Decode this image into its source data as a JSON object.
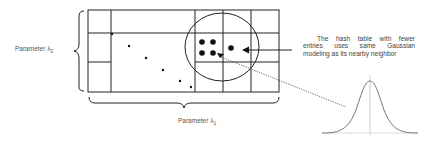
{
  "diagram": {
    "labels": {
      "param_y": "Parameter λ",
      "param_y_sub": "2",
      "param_x": "Parameter λ",
      "param_x_sub": "1"
    },
    "annotation": {
      "lines": [
        "The hash table with fewer",
        "entries uses same Gaussian",
        "modeling as its nearby neighbor"
      ]
    },
    "grid": {
      "x_lines": [
        88,
        111,
        195,
        223,
        251,
        279
      ],
      "y_lines": [
        10,
        33,
        62,
        92
      ]
    },
    "sparse_points": [
      [
        112,
        34
      ],
      [
        129,
        46
      ],
      [
        146,
        58
      ],
      [
        163,
        70
      ],
      [
        180,
        81
      ],
      [
        191,
        87
      ]
    ],
    "cluster_points": [
      [
        202,
        42
      ],
      [
        213,
        42
      ],
      [
        202,
        53
      ],
      [
        213,
        53
      ],
      [
        231,
        48
      ]
    ],
    "colors": {
      "line": "#222222",
      "text": "#555555",
      "gaussian": "#777777",
      "axis": "#cccccc"
    }
  }
}
